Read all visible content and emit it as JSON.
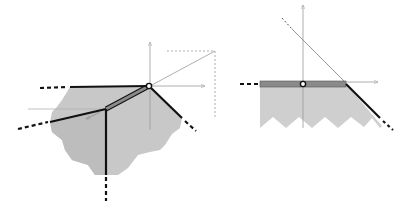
{
  "figure": {
    "panels": [
      {
        "id": "left",
        "description": "Polyhedral cone / tropical-style fan with two vertices, shaded region, and 3D axes at upper vertex",
        "colors": {
          "region": "#c8c8c8",
          "edge": "#111111",
          "band": "#8a8a8a",
          "axis": "#9a9a9a",
          "vertex_fill": "#ffffff"
        }
      },
      {
        "id": "right",
        "description": "Half-plane region with zigzag lower boundary, horizontal band edge with marked vertex, and axes",
        "colors": {
          "region": "#cfcfcf",
          "edge": "#111111",
          "band": "#8a8a8a",
          "axis": "#9a9a9a",
          "vertex_fill": "#ffffff"
        }
      }
    ]
  }
}
